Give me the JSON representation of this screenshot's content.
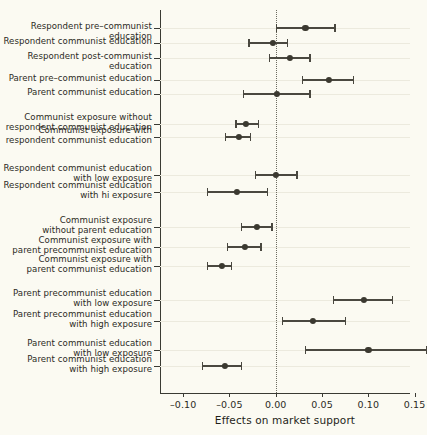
{
  "chart_data": {
    "type": "scatter",
    "title": "",
    "xlabel": "Effects on market support",
    "ylabel": "",
    "xlim": [
      -0.125,
      0.145
    ],
    "xticks": [
      -0.1,
      -0.05,
      0.0,
      0.05,
      0.1,
      0.15
    ],
    "xticklabels": [
      "–0.10",
      "–0.05",
      "0.00",
      "0.05",
      "0.10",
      "0.15"
    ],
    "grid": true,
    "legend": null,
    "reference_line": 0.0,
    "categories": [
      "Respondent pre–communist education",
      "Respondent communist education",
      "Respondent post-communist education",
      "Parent pre–communist education",
      "Parent communist education",
      "Communist exposure without\nrespondent communist education",
      "Communist exposure with\nrespondent communist education",
      "Respondent communist education\nwith low exposure",
      "Respondent communist education\nwith hi exposure",
      "Communist exposure\nwithout parent education",
      "Communist exposure with\nparent precommunist education",
      "Communist exposure with\nparent communist education",
      "Parent precommunist education\nwith low exposure",
      "Parent precommunist education\nwith high exposure",
      "Parent communist education\nwith low exposure",
      "Parent communist education\nwith high exposure"
    ],
    "estimates": [
      0.032,
      -0.003,
      0.015,
      0.057,
      0.001,
      -0.032,
      -0.04,
      0.0,
      -0.042,
      -0.02,
      -0.033,
      -0.058,
      0.095,
      0.04,
      0.1,
      -0.055
    ],
    "ci_low": [
      0.001,
      -0.029,
      -0.007,
      0.029,
      -0.035,
      -0.043,
      -0.054,
      -0.022,
      -0.074,
      -0.037,
      -0.052,
      -0.074,
      0.062,
      0.007,
      0.032,
      -0.079
    ],
    "ci_high": [
      0.064,
      0.013,
      0.037,
      0.084,
      0.037,
      -0.019,
      -0.027,
      0.023,
      -0.009,
      -0.004,
      -0.016,
      -0.048,
      0.126,
      0.075,
      0.163,
      -0.037
    ]
  },
  "colors": {
    "background": "#fbfaf2",
    "axis": "#3a3a33",
    "grid": "#eceade",
    "marker": "#3b3930",
    "zero_line": "#6c6b61"
  }
}
